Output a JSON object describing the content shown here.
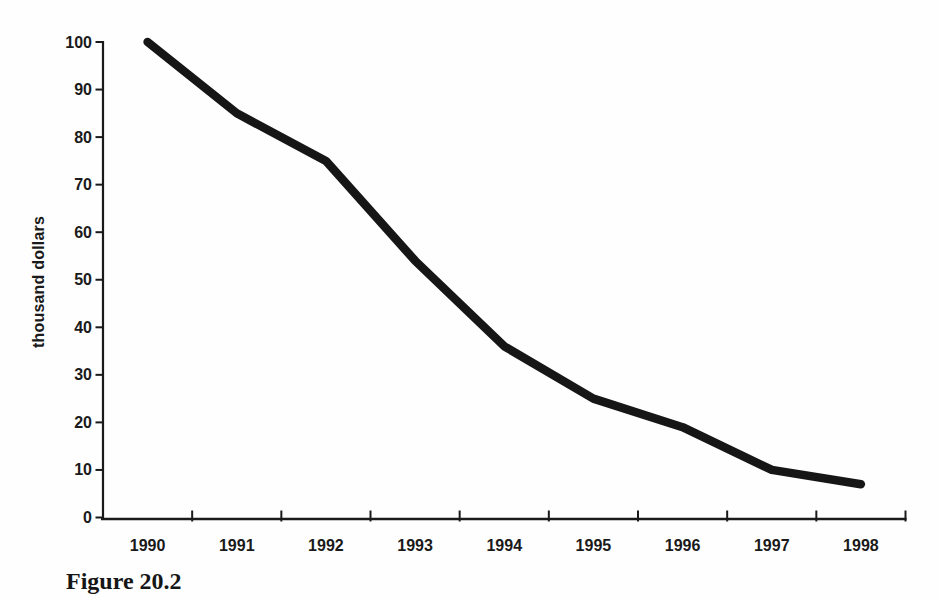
{
  "figure": {
    "caption": "Figure 20.2"
  },
  "colors": {
    "ink": "#1a1a1a",
    "background": "#fefefe"
  },
  "chart_data": {
    "type": "line",
    "title": "",
    "xlabel": "",
    "ylabel": "thousand dollars",
    "categories": [
      "1990",
      "1991",
      "1992",
      "1993",
      "1994",
      "1995",
      "1996",
      "1997",
      "1998"
    ],
    "values": [
      100,
      85,
      75,
      54,
      36,
      25,
      19,
      10,
      7
    ],
    "ylim": [
      0,
      100
    ],
    "yticks": [
      0,
      10,
      20,
      30,
      40,
      50,
      60,
      70,
      80,
      90,
      100
    ],
    "grid": "off",
    "legend": "none",
    "line_color": "#161616",
    "line_width": 8.5,
    "x_tick_style": "between-categories-inside",
    "y_tick_style": "outside"
  }
}
